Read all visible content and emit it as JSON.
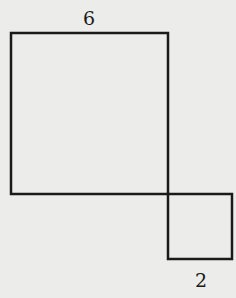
{
  "diagram": {
    "background": "#ececeb",
    "stroke": "#1a1a1a",
    "large_square": {
      "side_label": "6",
      "x": 11,
      "y": 33,
      "size": 157
    },
    "small_square": {
      "side_label": "2",
      "x": 168,
      "y": 194,
      "size": 64
    }
  }
}
